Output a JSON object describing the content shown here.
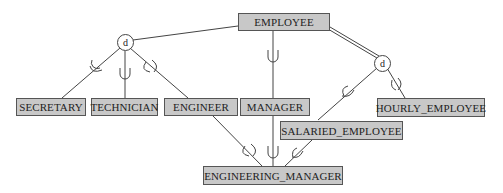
{
  "diagram": {
    "type": "EER specialization/generalization",
    "superclass": {
      "label": "EMPLOYEE"
    },
    "specializations": [
      {
        "symbol": "d",
        "constraint": "disjoint",
        "participation": "partial",
        "subclasses": [
          "SECRETARY",
          "TECHNICIAN",
          "ENGINEER"
        ]
      },
      {
        "symbol": "d",
        "constraint": "disjoint",
        "participation": "total",
        "subclasses": [
          "SALARIED_EMPLOYEE",
          "HOURLY_EMPLOYEE"
        ]
      }
    ],
    "direct_subclass": "MANAGER",
    "shared_subclass": {
      "label": "ENGINEERING_MANAGER",
      "superclasses": [
        "ENGINEER",
        "MANAGER",
        "SALARIED_EMPLOYEE"
      ]
    },
    "entities": {
      "employee": "EMPLOYEE",
      "secretary": "SECRETARY",
      "technician": "TECHNICIAN",
      "engineer": "ENGINEER",
      "manager": "MANAGER",
      "hourly_employee": "HOURLY_EMPLOYEE",
      "salaried_employee": "SALARIED_EMPLOYEE",
      "engineering_manager": "ENGINEERING_MANAGER"
    },
    "circles": {
      "left": "d",
      "right": "d"
    },
    "colors": {
      "entity_fill": "#c8c8c8",
      "entity_border": "#555555",
      "line": "#444444",
      "background": "#ffffff"
    }
  }
}
